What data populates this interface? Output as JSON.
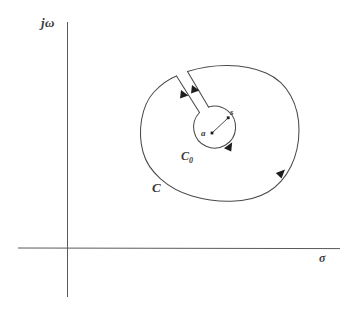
{
  "figure": {
    "type": "complex-plane-contour-diagram",
    "width": 351,
    "height": 319,
    "background_color": "#ffffff",
    "stroke_color": "#4a4a4a",
    "label_color": "#3b3b3b"
  },
  "axes": {
    "vertical": {
      "label": "jω",
      "label_text": "jω",
      "x": 67,
      "y_top": 22,
      "y_bottom": 297
    },
    "horizontal": {
      "label": "σ",
      "label_text": "σ",
      "y": 248,
      "x_left": 18,
      "x_right": 340
    }
  },
  "contours": {
    "outer": {
      "name": "C",
      "label": "C",
      "label_x": 157,
      "label_y": 188,
      "center_x": 220,
      "center_y": 132,
      "radius_x": 79,
      "radius_y": 69,
      "direction": "clockwise",
      "arrow_x": 280,
      "arrow_y": 176
    },
    "inner": {
      "name": "C0",
      "label": "C",
      "label_subscript": "0",
      "label_x": 187,
      "label_y": 156,
      "center_x": 211,
      "center_y": 133,
      "radius": 21,
      "direction": "clockwise",
      "arrow_x": 228,
      "arrow_y": 147
    },
    "slot": {
      "name": "branch-cut-channel",
      "outer_start_upper_x": 187,
      "outer_start_upper_y": 72,
      "outer_start_lower_x": 176,
      "outer_start_lower_y": 76,
      "inner_end_upper_x": 208,
      "inner_end_upper_y": 107,
      "inner_end_lower_x": 199,
      "inner_end_lower_y": 112,
      "arrow_upper_x": 196,
      "arrow_upper_y": 88,
      "arrow_lower_x": 185,
      "arrow_lower_y": 92
    }
  },
  "points": [
    {
      "id": "a",
      "label": "a",
      "x": 212,
      "y": 133,
      "description": "center-point-a"
    },
    {
      "id": "s",
      "label": "s",
      "x": 228,
      "y": 118,
      "description": "point-s-on-inner-circle"
    }
  ],
  "radius_line": {
    "name": "radius-a-to-s",
    "from_x": 212,
    "from_y": 133,
    "to_x": 228,
    "to_y": 118
  }
}
